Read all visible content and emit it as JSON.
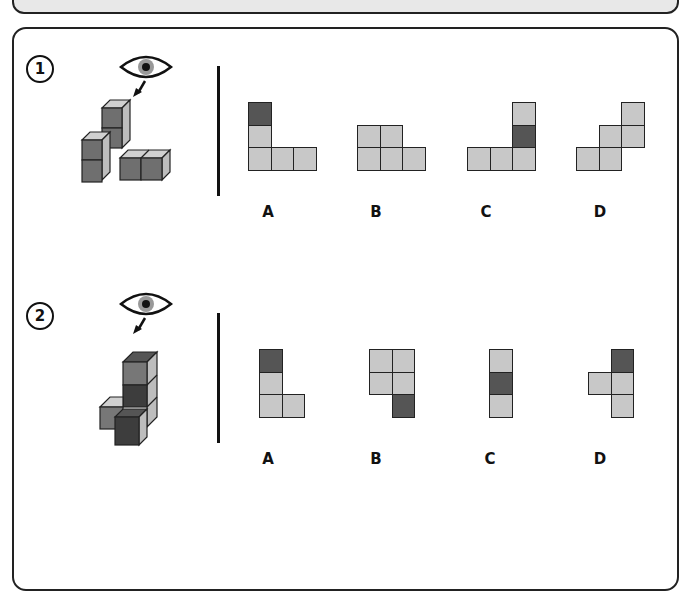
{
  "colors": {
    "light": "#c8c8c8",
    "dark": "#555555",
    "mid": "#7a7a7a",
    "border": "#222222"
  },
  "questions": [
    {
      "number": "1",
      "view_icon": "eye-icon",
      "options": [
        {
          "label": "A",
          "cells": [
            [
              0,
              0,
              "dark"
            ],
            [
              0,
              1,
              "light"
            ],
            [
              0,
              2,
              "light"
            ],
            [
              1,
              2,
              "light"
            ],
            [
              2,
              2,
              "light"
            ]
          ]
        },
        {
          "label": "B",
          "cells": [
            [
              0,
              1,
              "light"
            ],
            [
              1,
              1,
              "light"
            ],
            [
              0,
              2,
              "light"
            ],
            [
              1,
              2,
              "light"
            ],
            [
              2,
              2,
              "light"
            ]
          ]
        },
        {
          "label": "C",
          "cells": [
            [
              2,
              0,
              "light"
            ],
            [
              2,
              1,
              "dark"
            ],
            [
              0,
              2,
              "light"
            ],
            [
              1,
              2,
              "light"
            ],
            [
              2,
              2,
              "light"
            ]
          ]
        },
        {
          "label": "D",
          "cells": [
            [
              2,
              0,
              "light"
            ],
            [
              1,
              1,
              "light"
            ],
            [
              2,
              1,
              "light"
            ],
            [
              0,
              2,
              "light"
            ],
            [
              1,
              2,
              "light"
            ]
          ]
        }
      ]
    },
    {
      "number": "2",
      "view_icon": "eye-icon",
      "options": [
        {
          "label": "A",
          "cells": [
            [
              0,
              0,
              "dark"
            ],
            [
              0,
              1,
              "light"
            ],
            [
              0,
              2,
              "light"
            ],
            [
              1,
              2,
              "light"
            ]
          ]
        },
        {
          "label": "B",
          "cells": [
            [
              0,
              0,
              "light"
            ],
            [
              1,
              0,
              "light"
            ],
            [
              0,
              1,
              "light"
            ],
            [
              1,
              1,
              "light"
            ],
            [
              1,
              2,
              "dark"
            ]
          ]
        },
        {
          "label": "C",
          "cells": [
            [
              0,
              0,
              "light"
            ],
            [
              0,
              1,
              "dark"
            ],
            [
              0,
              2,
              "light"
            ]
          ]
        },
        {
          "label": "D",
          "cells": [
            [
              1,
              0,
              "dark"
            ],
            [
              0,
              1,
              "light"
            ],
            [
              1,
              1,
              "light"
            ],
            [
              1,
              2,
              "light"
            ]
          ]
        }
      ]
    }
  ],
  "q1": {
    "number": "1",
    "labels": [
      "A",
      "B",
      "C",
      "D"
    ]
  },
  "q2": {
    "number": "2",
    "labels": [
      "A",
      "B",
      "C",
      "D"
    ]
  }
}
